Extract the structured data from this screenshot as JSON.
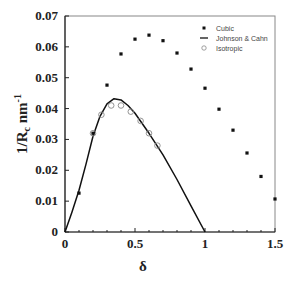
{
  "chart_data": {
    "type": "scatter",
    "title": "",
    "xlabel": "δ",
    "ylabel": "1/R_c nm^-1",
    "xlim": [
      0,
      1.5
    ],
    "ylim": [
      0,
      0.07
    ],
    "x_ticks": [
      "0",
      "0.5",
      "1",
      "1.5"
    ],
    "y_ticks": [
      "0",
      "0.01",
      "0.02",
      "0.03",
      "0.04",
      "0.05",
      "0.06",
      "0.07"
    ],
    "grid": false,
    "legend_position": "upper right",
    "series": [
      {
        "name": "Cubic",
        "style": "filled-square-marker",
        "x": [
          0.1,
          0.2,
          0.3,
          0.4,
          0.5,
          0.6,
          0.7,
          0.8,
          0.9,
          1.0,
          1.1,
          1.2,
          1.3,
          1.4,
          1.5
        ],
        "y": [
          0.0126,
          0.032,
          0.0476,
          0.0577,
          0.0625,
          0.0638,
          0.062,
          0.058,
          0.0528,
          0.0466,
          0.0398,
          0.033,
          0.0256,
          0.018,
          0.0107
        ]
      },
      {
        "name": "Johnson & Cahn",
        "style": "line",
        "x": [
          0,
          0.05,
          0.1,
          0.15,
          0.2,
          0.25,
          0.3,
          0.35,
          0.4,
          0.45,
          0.5,
          0.6,
          0.7,
          0.8,
          0.9,
          1.0
        ],
        "y": [
          0,
          0.0065,
          0.0135,
          0.022,
          0.031,
          0.0375,
          0.0415,
          0.0432,
          0.0428,
          0.041,
          0.0385,
          0.032,
          0.025,
          0.017,
          0.0085,
          0
        ]
      },
      {
        "name": "Isotropic",
        "style": "open-circle-marker",
        "x": [
          0.2,
          0.26,
          0.33,
          0.4,
          0.47,
          0.54,
          0.6,
          0.66
        ],
        "y": [
          0.032,
          0.038,
          0.041,
          0.041,
          0.039,
          0.036,
          0.032,
          0.028
        ]
      }
    ]
  },
  "axes": {
    "x_title": "δ",
    "y_title_main": "1/R",
    "y_title_sub": "c",
    "y_title_unit": " nm",
    "y_title_sup": "-1"
  },
  "legend": {
    "items": [
      {
        "label": "Cubic"
      },
      {
        "label": "Johnson & Cahn"
      },
      {
        "label": "Isotropic"
      }
    ]
  }
}
